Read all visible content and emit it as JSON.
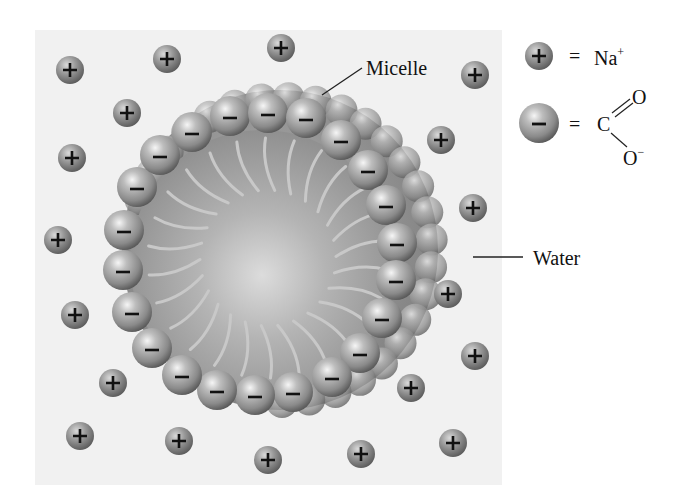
{
  "labels": {
    "micelle": "Micelle",
    "water": "Water"
  },
  "legend": {
    "items": [
      {
        "icon": "sodium-ion-icon",
        "symbol": "+",
        "equals": "=",
        "text": "Na",
        "superscript": "+"
      },
      {
        "icon": "carboxylate-head-icon",
        "symbol": "−",
        "equals": "=",
        "formula": {
          "center": "C",
          "double_bond_atom": "O",
          "single_bond_atom": "O",
          "charge": "−"
        }
      }
    ]
  },
  "diagram": {
    "micelle_center": [
      268,
      258
    ],
    "head_ring_radius": 148,
    "head_radius": 20,
    "tail_count": 26,
    "sodium_ions": [
      [
        70,
        70
      ],
      [
        167,
        59
      ],
      [
        281,
        48
      ],
      [
        127,
        113
      ],
      [
        475,
        75
      ],
      [
        441,
        140
      ],
      [
        72,
        158
      ],
      [
        473,
        208
      ],
      [
        58,
        240
      ],
      [
        448,
        294
      ],
      [
        75,
        315
      ],
      [
        475,
        356
      ],
      [
        113,
        383
      ],
      [
        411,
        388
      ],
      [
        80,
        436
      ],
      [
        179,
        441
      ],
      [
        268,
        460
      ],
      [
        361,
        454
      ],
      [
        453,
        443
      ]
    ],
    "head_groups_front": [
      [
        230,
        116
      ],
      [
        268,
        113
      ],
      [
        306,
        118
      ],
      [
        341,
        140
      ],
      [
        368,
        170
      ],
      [
        386,
        205
      ],
      [
        397,
        243
      ],
      [
        396,
        280
      ],
      [
        382,
        318
      ],
      [
        360,
        353
      ],
      [
        332,
        377
      ],
      [
        293,
        392
      ],
      [
        255,
        395
      ],
      [
        217,
        390
      ],
      [
        182,
        375
      ],
      [
        152,
        348
      ],
      [
        132,
        312
      ],
      [
        123,
        270
      ],
      [
        124,
        230
      ],
      [
        137,
        187
      ],
      [
        160,
        155
      ],
      [
        192,
        132
      ]
    ],
    "colors": {
      "water": "#f1f1f1",
      "core": "#9a9a9a",
      "core_light": "#d6d6d6",
      "sphere_dark": "#5e5e5e",
      "sphere_mid": "#9e9e9e",
      "sphere_light": "#f4f4f4",
      "tail": "#c8c8c8",
      "text": "#111111"
    }
  }
}
